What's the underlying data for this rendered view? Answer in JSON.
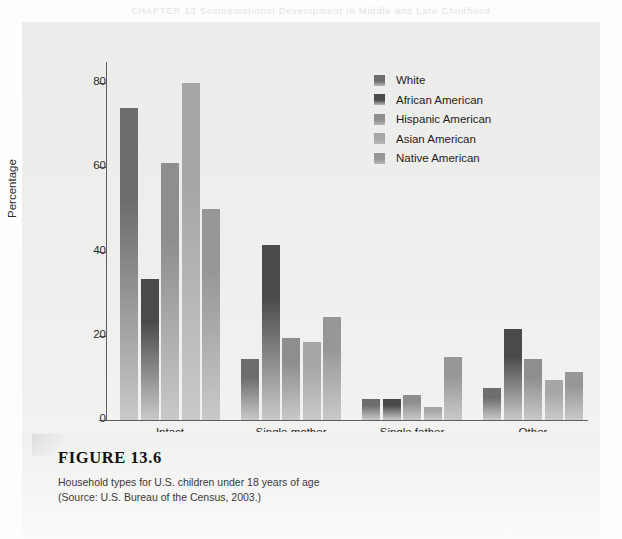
{
  "page": {
    "ghost_header": "CHAPTER 13   Socioemotional Development in Middle and Late Childhood"
  },
  "figure": {
    "number_label": "FIGURE 13.6",
    "caption_line1": "Household types for U.S. children under 18 years of age",
    "caption_line2": "(Source: U.S. Bureau of the Census, 2003.)"
  },
  "legend": {
    "items": [
      {
        "label": "White",
        "color": "#6d6d6d"
      },
      {
        "label": "African American",
        "color": "#4a4a4a"
      },
      {
        "label": "Hispanic American",
        "color": "#8e8e8e"
      },
      {
        "label": "Asian American",
        "color": "#a6a6a6"
      },
      {
        "label": "Native American",
        "color": "#979797"
      }
    ]
  },
  "axes": {
    "y_title": "Percentage",
    "x_title": "Family structure",
    "y_ticks": [
      "0",
      "20",
      "40",
      "60",
      "80"
    ]
  },
  "chart_data": {
    "type": "bar",
    "title": "Household types for U.S. children under 18 years of age",
    "xlabel": "Family structure",
    "ylabel": "Percentage",
    "ylim": [
      0,
      85
    ],
    "yticks": [
      0,
      20,
      40,
      60,
      80
    ],
    "grid": false,
    "legend_position": "top-right",
    "categories": [
      "Intact",
      "Single mother",
      "Single father",
      "Other"
    ],
    "series": [
      {
        "name": "White",
        "color": "#6d6d6d",
        "values": [
          74.0,
          14.5,
          5.0,
          7.5
        ]
      },
      {
        "name": "African American",
        "color": "#4a4a4a",
        "values": [
          33.5,
          41.5,
          5.0,
          21.5
        ]
      },
      {
        "name": "Hispanic American",
        "color": "#8e8e8e",
        "values": [
          61.0,
          19.5,
          6.0,
          14.5
        ]
      },
      {
        "name": "Asian American",
        "color": "#a6a6a6",
        "values": [
          80.0,
          18.5,
          3.0,
          9.5
        ]
      },
      {
        "name": "Native American",
        "color": "#979797",
        "values": [
          50.0,
          24.5,
          15.0,
          11.5
        ]
      }
    ],
    "source": "U.S. Bureau of the Census, 2003."
  }
}
